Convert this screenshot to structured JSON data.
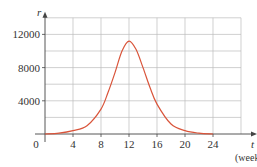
{
  "chart_data": {
    "type": "line",
    "title": "",
    "xlabel": "t",
    "xunit": "(weeks)",
    "ylabel": "r",
    "xlim": [
      0,
      26
    ],
    "ylim": [
      0,
      14000
    ],
    "grid": true,
    "x_ticks": [
      0,
      4,
      8,
      12,
      16,
      20,
      24
    ],
    "x_tick_labels": [
      "0",
      "4",
      "8",
      "12",
      "16",
      "20",
      "24"
    ],
    "y_ticks": [
      4000,
      8000,
      12000
    ],
    "y_tick_labels": [
      "4000",
      "8000",
      "12000"
    ],
    "series": [
      {
        "name": "r(t)",
        "color": "#d9543a",
        "x": [
          0,
          2,
          4,
          6,
          8,
          9,
          10,
          11,
          12,
          13,
          14,
          15,
          16,
          18,
          20,
          22,
          24
        ],
        "values": [
          0,
          100,
          400,
          1000,
          3000,
          5000,
          7400,
          10000,
          11200,
          10200,
          8000,
          5600,
          3600,
          1200,
          400,
          100,
          0
        ]
      }
    ]
  }
}
